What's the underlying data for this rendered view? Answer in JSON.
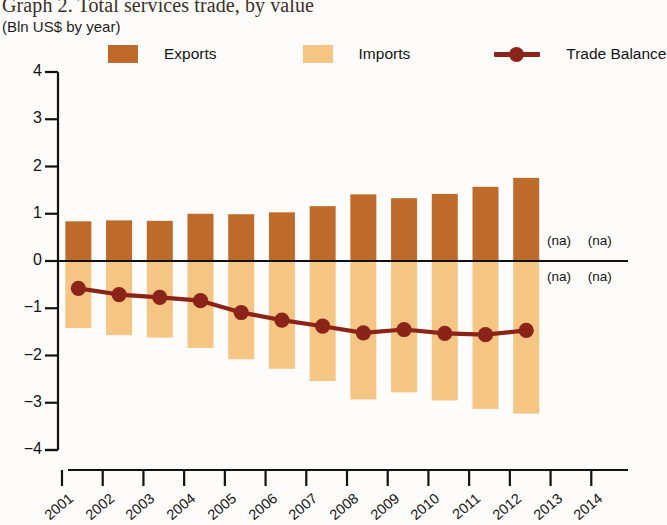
{
  "header": {
    "title": "Graph 2. Total services trade, by value",
    "subtitle": "(Bln US$ by year)"
  },
  "legend": {
    "items": [
      {
        "label": "Exports",
        "marker": "square-swatch",
        "color": "#BE6A2B"
      },
      {
        "label": "Imports",
        "marker": "square-swatch",
        "color": "#F5C583"
      },
      {
        "label": "Trade Balance",
        "marker": "line-with-dot",
        "color": "#8B2318"
      }
    ]
  },
  "annotations": {
    "na_text": "(na)",
    "na_positions": [
      "2013-exports",
      "2014-exports",
      "2013-imports",
      "2014-imports"
    ]
  },
  "colors": {
    "exports": "#BE6A2B",
    "imports": "#F5C583",
    "balance": "#8B2318",
    "axis": "#111111",
    "background": "#fdfcfa"
  },
  "chart_data": {
    "type": "bar",
    "title": "Graph 2. Total services trade, by value",
    "subtitle": "(Bln US$ by year)",
    "xlabel": "",
    "ylabel": "Bln US$",
    "ylim": [
      -4,
      4
    ],
    "yticks": [
      4,
      3,
      2,
      1,
      0,
      -1,
      -2,
      -3,
      -4
    ],
    "ytick_labels": [
      "4",
      "3",
      "2",
      "1",
      "0",
      "−1",
      "−2",
      "−3",
      "−4"
    ],
    "grid": false,
    "legend_position": "top",
    "categories": [
      "2001",
      "2002",
      "2003",
      "2004",
      "2005",
      "2006",
      "2007",
      "2008",
      "2009",
      "2010",
      "2011",
      "2012",
      "2013",
      "2014"
    ],
    "series": [
      {
        "name": "Exports",
        "type": "bar",
        "color": "#BE6A2B",
        "values": [
          0.84,
          0.86,
          0.85,
          1.0,
          0.99,
          1.03,
          1.16,
          1.41,
          1.33,
          1.42,
          1.57,
          1.76,
          null,
          null
        ]
      },
      {
        "name": "Imports",
        "type": "bar",
        "color": "#F5C583",
        "values": [
          -1.42,
          -1.57,
          -1.62,
          -1.84,
          -2.08,
          -2.28,
          -2.54,
          -2.93,
          -2.78,
          -2.95,
          -3.13,
          -3.23,
          null,
          null
        ]
      },
      {
        "name": "Trade Balance",
        "type": "line",
        "color": "#8B2318",
        "values": [
          -0.58,
          -0.71,
          -0.77,
          -0.84,
          -1.09,
          -1.25,
          -1.38,
          -1.52,
          -1.45,
          -1.53,
          -1.56,
          -1.47,
          null,
          null
        ]
      }
    ]
  }
}
